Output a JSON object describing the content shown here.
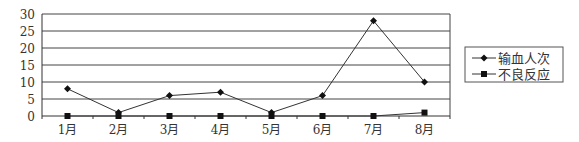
{
  "chart_data": {
    "type": "line",
    "title": "",
    "xlabel": "",
    "ylabel": "",
    "categories": [
      "1月",
      "2月",
      "3月",
      "4月",
      "5月",
      "6月",
      "7月",
      "8月"
    ],
    "series": [
      {
        "name": "输血人次",
        "marker": "diamond",
        "values": [
          8,
          1,
          6,
          7,
          1,
          6,
          28,
          10
        ]
      },
      {
        "name": "不良反应",
        "marker": "square",
        "values": [
          0,
          0,
          0,
          0,
          0,
          0,
          0,
          1
        ]
      }
    ],
    "ylim": [
      0,
      30
    ],
    "yticks": [
      0,
      5,
      10,
      15,
      20,
      25,
      30
    ],
    "grid": true,
    "legend_position": "right"
  },
  "colors": {
    "line": "#333333",
    "grid": "#444444",
    "marker": "#111111"
  }
}
